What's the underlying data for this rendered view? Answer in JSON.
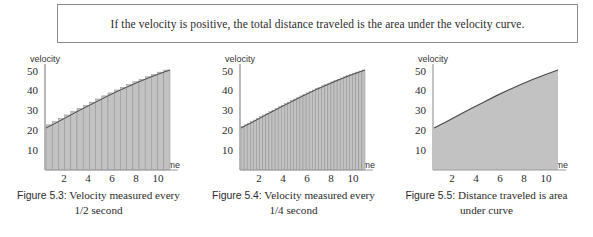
{
  "callout": {
    "text": "If the velocity is positive, the total distance traveled is the area under the velocity curve."
  },
  "figures": [
    {
      "id": "figure-5-3",
      "caption_label": "Figure 5.3:",
      "caption_line1": "Velocity measured every",
      "caption_line2": "1/2 second",
      "ylabel": "velocity",
      "xlabel": "time"
    },
    {
      "id": "figure-5-4",
      "caption_label": "Figure 5.4:",
      "caption_line1": "Velocity measured every",
      "caption_line2": "1/4 second",
      "ylabel": "velocity",
      "xlabel": "time"
    },
    {
      "id": "figure-5-5",
      "caption_label": "Figure 5.5:",
      "caption_line1": "Distance traveled is area",
      "caption_line2": "under curve",
      "ylabel": "velocity",
      "xlabel": "time"
    }
  ],
  "chart_data": [
    {
      "type": "bar",
      "title": "Figure 5.3: Velocity measured every 1/2 second",
      "xlabel": "time",
      "ylabel": "velocity",
      "xlim": [
        0,
        11
      ],
      "ylim": [
        0,
        55
      ],
      "xticks": [
        2,
        4,
        6,
        8,
        10
      ],
      "yticks": [
        10,
        20,
        30,
        40,
        50
      ],
      "grid": false,
      "legend": null,
      "bar_width": 0.5,
      "x": [
        0.5,
        1.0,
        1.5,
        2.0,
        2.5,
        3.0,
        3.5,
        4.0,
        4.5,
        5.0,
        5.5,
        6.0,
        6.5,
        7.0,
        7.5,
        8.0,
        8.5,
        9.0,
        9.5,
        10.0
      ],
      "values": [
        21.5,
        23.0,
        24.6,
        26.2,
        27.8,
        29.3,
        30.8,
        32.3,
        33.8,
        35.3,
        36.7,
        38.1,
        39.4,
        40.7,
        42.0,
        43.2,
        44.4,
        45.5,
        46.6,
        47.6
      ],
      "curve": {
        "name": "velocity curve",
        "x": [
          0,
          0.5,
          1,
          1.5,
          2,
          2.5,
          3,
          3.5,
          4,
          4.5,
          5,
          5.5,
          6,
          6.5,
          7,
          7.5,
          8,
          8.5,
          9,
          9.5,
          10
        ],
        "y": [
          20.0,
          21.5,
          23.0,
          24.6,
          26.2,
          27.8,
          29.3,
          30.8,
          32.3,
          33.8,
          35.3,
          36.7,
          38.1,
          39.4,
          40.7,
          42.0,
          43.2,
          44.4,
          45.5,
          46.6,
          47.6
        ]
      }
    },
    {
      "type": "bar",
      "title": "Figure 5.4: Velocity measured every 1/4 second",
      "xlabel": "time",
      "ylabel": "velocity",
      "xlim": [
        0,
        11
      ],
      "ylim": [
        0,
        55
      ],
      "xticks": [
        2,
        4,
        6,
        8,
        10
      ],
      "yticks": [
        10,
        20,
        30,
        40,
        50
      ],
      "grid": false,
      "legend": null,
      "bar_width": 0.25,
      "x": [
        0.25,
        0.5,
        0.75,
        1.0,
        1.25,
        1.5,
        1.75,
        2.0,
        2.25,
        2.5,
        2.75,
        3.0,
        3.25,
        3.5,
        3.75,
        4.0,
        4.25,
        4.5,
        4.75,
        5.0,
        5.25,
        5.5,
        5.75,
        6.0,
        6.25,
        6.5,
        6.75,
        7.0,
        7.25,
        7.5,
        7.75,
        8.0,
        8.25,
        8.5,
        8.75,
        9.0,
        9.25,
        9.5,
        9.75,
        10.0
      ],
      "values": [
        20.8,
        21.5,
        22.3,
        23.0,
        23.8,
        24.6,
        25.4,
        26.2,
        27.0,
        27.8,
        28.5,
        29.3,
        30.1,
        30.8,
        31.6,
        32.3,
        33.1,
        33.8,
        34.5,
        35.3,
        36.0,
        36.7,
        37.4,
        38.1,
        38.8,
        39.4,
        40.1,
        40.7,
        41.4,
        42.0,
        42.6,
        43.2,
        43.8,
        44.4,
        45.0,
        45.5,
        46.1,
        46.6,
        47.1,
        47.6
      ],
      "curve": {
        "name": "velocity curve",
        "x": [
          0,
          1,
          2,
          3,
          4,
          5,
          6,
          7,
          8,
          9,
          10
        ],
        "y": [
          20.0,
          23.0,
          26.2,
          29.3,
          32.3,
          35.3,
          38.1,
          40.7,
          43.2,
          45.5,
          47.6
        ]
      }
    },
    {
      "type": "area",
      "title": "Figure 5.5: Distance traveled is area under curve",
      "xlabel": "time",
      "ylabel": "velocity",
      "xlim": [
        0,
        11
      ],
      "ylim": [
        0,
        55
      ],
      "xticks": [
        2,
        4,
        6,
        8,
        10
      ],
      "yticks": [
        10,
        20,
        30,
        40,
        50
      ],
      "grid": false,
      "legend": null,
      "series": [
        {
          "name": "velocity curve",
          "x": [
            0,
            1,
            2,
            3,
            4,
            5,
            6,
            7,
            8,
            9,
            10
          ],
          "y": [
            20.0,
            23.0,
            26.2,
            29.3,
            32.3,
            35.3,
            38.1,
            40.7,
            43.2,
            45.5,
            47.6
          ]
        }
      ]
    }
  ],
  "colors": {
    "fill": "#c2c2c2",
    "curve": "#4a4a4a",
    "axis": "#777777",
    "text": "#2b2b2b",
    "box_border": "#8a8a8a"
  }
}
